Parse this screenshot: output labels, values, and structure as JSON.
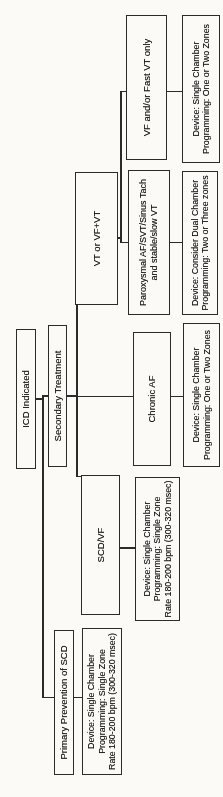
{
  "nodes": {
    "icd_indicated": {
      "label": "ICD Indicated"
    },
    "secondary_treatment": {
      "label": "Secondary Treatment"
    },
    "primary_prevention": {
      "label": "Primary Prevention of SCD"
    },
    "scd_vf": {
      "label": "SCD/VF"
    },
    "chronic_af": {
      "label": "Chronic AF"
    },
    "vt_or_vf_vt": {
      "label": "VT or VF+VT"
    },
    "paroxysmal_af_svt": {
      "lines": [
        "Paroxysmal AF/SVT/Sinus Tach",
        "and stable/slow VT"
      ]
    },
    "vf_fast_vt_only": {
      "label": "VF and/or Fast VT only"
    }
  },
  "devices": {
    "primary_prevention": {
      "lines": [
        "Device: Single Chamber",
        "Programming: Single Zone",
        "Rate 180-200 bpm (300-320 msec)"
      ]
    },
    "scd_vf": {
      "lines": [
        "Device: Single Chamber",
        "Programming: Single Zone",
        "Rate 180-200 bpm (300-320 msec)"
      ]
    },
    "chronic_af": {
      "lines": [
        "Device: Single Chamber",
        "Programming: One or Two Zones"
      ]
    },
    "paroxysmal_af_svt": {
      "lines": [
        "Device: Consider Dual Chamber",
        "Programming: Two or Three zones"
      ]
    },
    "vf_fast_vt_only": {
      "lines": [
        "Device: Single Chamber",
        "Programming: One or Two Zones"
      ]
    }
  },
  "colors": {
    "line": "#2b2b2b",
    "text": "#141414",
    "page_background": "#fbfaf7"
  }
}
